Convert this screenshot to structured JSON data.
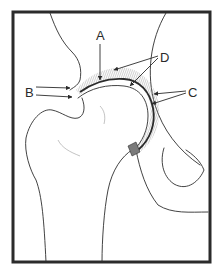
{
  "figure": {
    "labels": [
      {
        "id": "A",
        "text": "A"
      },
      {
        "id": "B",
        "text": "B"
      },
      {
        "id": "C",
        "text": "C"
      },
      {
        "id": "D",
        "text": "D"
      }
    ],
    "colors": {
      "ink": "#2b2b2b",
      "hatch": "#9a9a9a",
      "background": "#ffffff"
    }
  }
}
